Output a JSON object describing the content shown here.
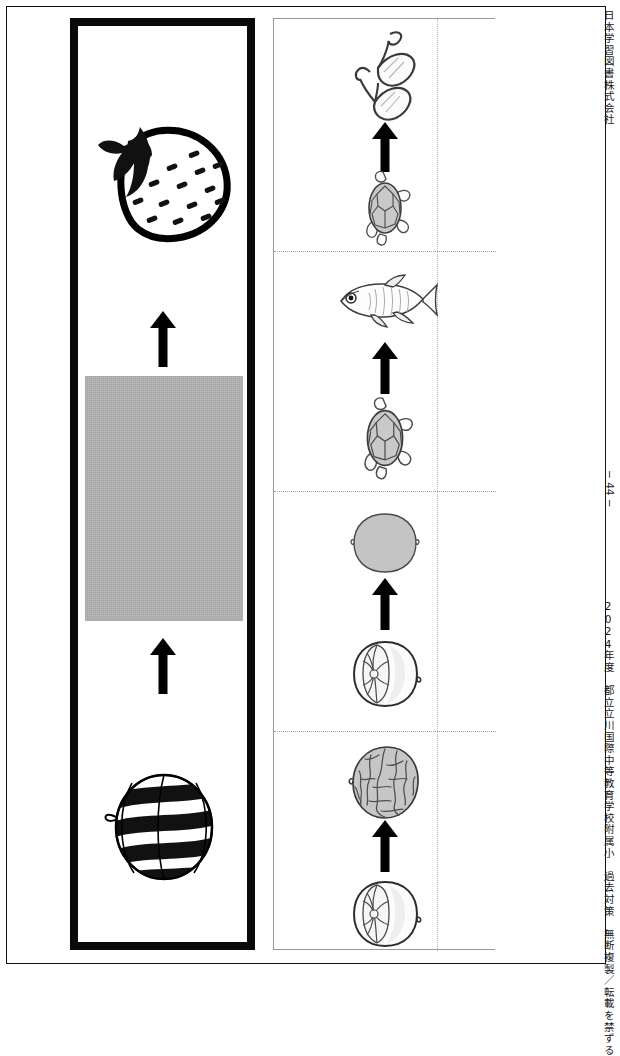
{
  "page": {
    "publisher": "日本学習図書株式会社",
    "credit": "2024年度　都立立川国際中等教育学校附属小　過去対策　無断複製／転載を禁ずる",
    "page_number": "− 44 −"
  },
  "question_panel": {
    "name": "sequence-question-panel",
    "sequence": [
      {
        "id": "watermelon",
        "label": "すいか",
        "icon": "watermelon-icon",
        "state": "given"
      },
      {
        "id": "arrow-1",
        "label": "↑",
        "icon": "arrow-up-icon",
        "state": "given"
      },
      {
        "id": "hidden",
        "label": "",
        "icon": "hidden-answer-box",
        "state": "hidden",
        "fill": "#b9b9b9"
      },
      {
        "id": "arrow-2",
        "label": "↑",
        "icon": "arrow-up-icon",
        "state": "given"
      },
      {
        "id": "strawberry",
        "label": "いちご",
        "icon": "strawberry-icon",
        "state": "given"
      }
    ]
  },
  "choice_panel": {
    "name": "answer-choices-panel",
    "choices": [
      {
        "index": 1,
        "bottom": {
          "id": "turtle",
          "label": "かめ",
          "icon": "turtle-icon"
        },
        "arrow": {
          "id": "arrow",
          "label": "↑",
          "icon": "arrow-up-icon"
        },
        "top": {
          "id": "glasses",
          "label": "めがね",
          "icon": "glasses-icon"
        }
      },
      {
        "index": 2,
        "bottom": {
          "id": "turtle",
          "label": "かめ",
          "icon": "turtle-icon"
        },
        "arrow": {
          "id": "arrow",
          "label": "↑",
          "icon": "arrow-up-icon"
        },
        "top": {
          "id": "fish",
          "label": "めだか",
          "icon": "fish-icon"
        }
      },
      {
        "index": 3,
        "bottom": {
          "id": "walnut-kernel",
          "label": "くるみのなかみ",
          "icon": "walnut-kernel-icon"
        },
        "arrow": {
          "id": "arrow",
          "label": "↑",
          "icon": "arrow-up-icon"
        },
        "top": {
          "id": "walnut-smooth",
          "label": "くるみ",
          "icon": "walnut-smooth-icon"
        }
      },
      {
        "index": 4,
        "bottom": {
          "id": "walnut-kernel",
          "label": "くるみのなかみ",
          "icon": "walnut-kernel-icon"
        },
        "arrow": {
          "id": "arrow",
          "label": "↑",
          "icon": "arrow-up-icon"
        },
        "top": {
          "id": "walnut-shell",
          "label": "くるみのから",
          "icon": "walnut-shell-icon"
        }
      }
    ]
  },
  "colors": {
    "ink": "#000000",
    "hidden_box": "#b9b9b9",
    "thin_rule": "#9a9a9a",
    "dotted_rule": "#b9b9b9"
  }
}
